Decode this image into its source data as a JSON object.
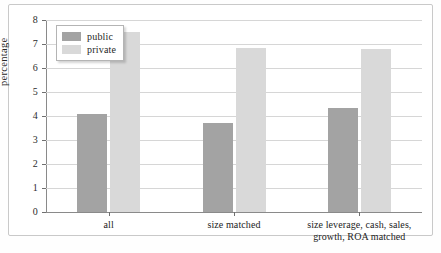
{
  "chart_data": {
    "type": "bar",
    "title": "",
    "xlabel": "",
    "ylabel": "percentage",
    "ylim": [
      0,
      8
    ],
    "ytick_values": [
      0,
      1,
      2,
      3,
      4,
      5,
      6,
      7,
      8
    ],
    "ytick_labels": [
      "0",
      "1",
      "2",
      "3",
      "4",
      "5",
      "6",
      "7",
      "8"
    ],
    "grid": true,
    "legend_position": "upper-left-inside",
    "categories": [
      "all",
      "size matched",
      "size leverage, cash, sales, growth, ROA matched"
    ],
    "category_lines": [
      [
        "all"
      ],
      [
        "size matched"
      ],
      [
        "size leverage, cash, sales,",
        "growth, ROA matched"
      ]
    ],
    "series": [
      {
        "name": "public",
        "color": "#a3a3a3",
        "values": [
          4.08,
          3.7,
          4.35
        ]
      },
      {
        "name": "private",
        "color": "#d9d9d9",
        "values": [
          7.5,
          6.85,
          6.8
        ]
      }
    ]
  },
  "legend": {
    "items": [
      {
        "label": "public"
      },
      {
        "label": "private"
      }
    ]
  },
  "axes": {
    "y_label": "percentage"
  }
}
